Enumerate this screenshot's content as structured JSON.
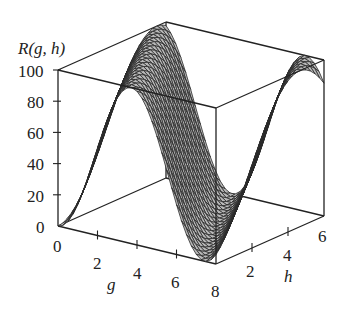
{
  "chart_data": {
    "type": "surface3d",
    "title": "",
    "zlabel": "R(g, h)",
    "xlabel": "g",
    "ylabel": "h",
    "xlim": [
      0,
      8
    ],
    "ylim": [
      0,
      6
    ],
    "zlim": [
      0,
      100
    ],
    "x_ticks": [
      "0",
      "2",
      "4",
      "6",
      "8"
    ],
    "y_ticks": [
      "2",
      "4",
      "6"
    ],
    "z_ticks": [
      "0",
      "20",
      "40",
      "60",
      "80",
      "100"
    ],
    "surface_fill": "#b8b8b8",
    "mesh_color": "#2a2a2a",
    "box": "on",
    "grid": "off",
    "sample_points": [
      {
        "g": 0,
        "h": 0,
        "R": 0
      },
      {
        "g": 0,
        "h": 3,
        "R": 65
      },
      {
        "g": 3,
        "h": 3,
        "R": 95
      },
      {
        "g": 6.5,
        "h": 0,
        "R": 0
      },
      {
        "g": 8,
        "h": 6,
        "R": 75
      }
    ]
  },
  "axis_labels": {
    "z": "R(g, h)",
    "g": "g",
    "h": "h"
  },
  "ticks": {
    "z": [
      "100",
      "80",
      "60",
      "40",
      "20",
      "0"
    ],
    "g": [
      "0",
      "2",
      "4",
      "6",
      "8"
    ],
    "h": [
      "2",
      "4",
      "6"
    ]
  }
}
